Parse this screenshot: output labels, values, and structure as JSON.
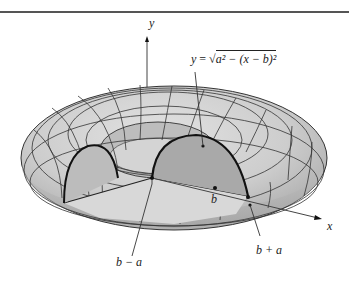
{
  "figure": {
    "axes": {
      "y_label": "y",
      "x_label": "x"
    },
    "annotations": {
      "curve_equation": {
        "lhs": "y",
        "equals": "=",
        "sqrt_content": "a² − (x − b)²"
      },
      "center_label": "b",
      "inner_radius_label": "b − a",
      "outer_radius_label": "b + a"
    },
    "colors": {
      "surface_fill": "#cfcfcf",
      "surface_dark": "#a8a8a8",
      "cross_section_fill": "#b8b8b8",
      "grid_line": "#333333",
      "outline": "#111111",
      "axis": "#444444",
      "top_rule": "#555555"
    }
  }
}
